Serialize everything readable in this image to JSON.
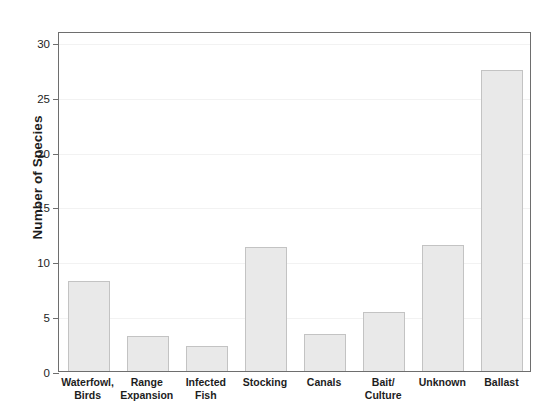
{
  "chart_data": {
    "type": "bar",
    "title": "",
    "subtitle": "",
    "xlabel": "",
    "ylabel": "Number of Species",
    "categories": [
      "Waterfowl, Birds",
      "Range Expansion",
      "Infected Fish",
      "Stocking",
      "Canals",
      "Bait/ Culture",
      "Unknown",
      "Ballast"
    ],
    "category_lines": [
      [
        "Waterfowl,",
        "Birds"
      ],
      [
        "Range",
        "Expansion"
      ],
      [
        "Infected",
        "Fish"
      ],
      [
        "Stocking"
      ],
      [
        "Canals"
      ],
      [
        "Bait/",
        "Culture"
      ],
      [
        "Unknown"
      ],
      [
        "Ballast"
      ]
    ],
    "values": [
      8.2,
      3.2,
      2.3,
      11.3,
      3.4,
      5.4,
      11.5,
      27.4
    ],
    "ylim": [
      0,
      31
    ],
    "yticks": [
      0,
      5,
      10,
      15,
      20,
      25,
      30
    ],
    "ytick_labels": [
      "0",
      "5",
      "10",
      "15",
      "20",
      "25",
      "30"
    ],
    "grid": true,
    "legend": "none",
    "bar_color": "#e9e9e9",
    "bar_border_color": "#c3c3c3",
    "axis_color": "#6e6e6e",
    "grid_color": "#f2f2f2",
    "text_color": "#1d1d1d",
    "background": "#ffffff"
  }
}
